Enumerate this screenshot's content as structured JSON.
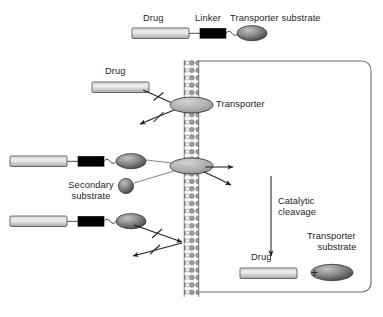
{
  "figure": {
    "colors": {
      "drug_fill_light": "#e8e8e8",
      "drug_fill_dark": "#b4b4b4",
      "linker_fill": "#000000",
      "substrate_fill_light": "#9a9a9a",
      "substrate_fill_dark": "#4d4d4d",
      "membrane": "#8c8c8c",
      "outline": "#231f20",
      "cell_border": "#6e6e6e"
    }
  },
  "legend": {
    "drug_label": "Drug",
    "linker_label": "Linker",
    "substrate_label": "Transporter substrate"
  },
  "extracellular": {
    "free_drug_label": "Drug",
    "transporter_label": "Transporter",
    "secondary_substrate_label_line1": "Secondary",
    "secondary_substrate_label_line2": "substrate"
  },
  "intracellular": {
    "cleavage_label_line1": "Catalytic",
    "cleavage_label_line2": "cleavage",
    "product_drug_label": "Drug",
    "product_plus": "+",
    "product_substrate_label_line1": "Transporter",
    "product_substrate_label_line2": "substrate"
  }
}
